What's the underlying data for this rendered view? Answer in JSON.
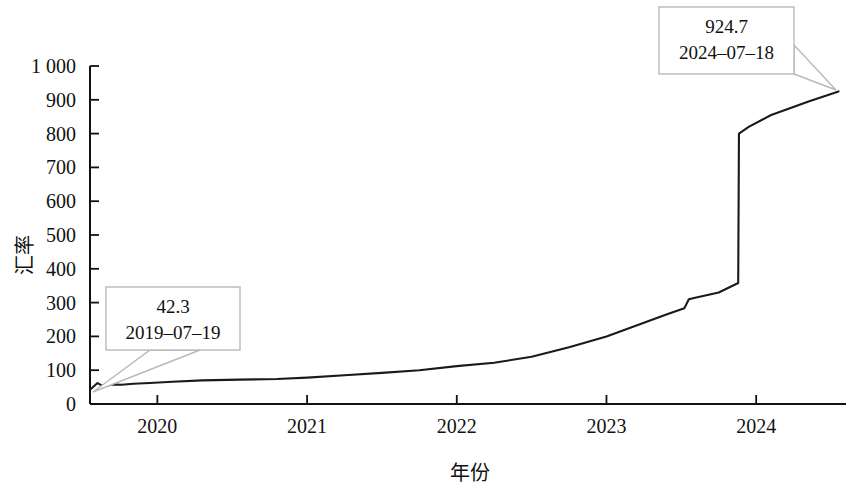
{
  "chart_data": {
    "type": "line",
    "title": "",
    "xlabel": "年份",
    "ylabel": "汇率",
    "xlim": [
      2019.55,
      2024.6
    ],
    "ylim": [
      0,
      1000
    ],
    "grid": false,
    "legend": null,
    "x_tick_labels": [
      "2020",
      "2021",
      "2022",
      "2023",
      "2024"
    ],
    "x_tick_values": [
      2020,
      2021,
      2022,
      2023,
      2024
    ],
    "y_tick_labels": [
      "0",
      "100",
      "200",
      "300",
      "400",
      "500",
      "600",
      "700",
      "800",
      "900",
      "1 000"
    ],
    "y_tick_values": [
      0,
      100,
      200,
      300,
      400,
      500,
      600,
      700,
      800,
      900,
      1000
    ],
    "series": [
      {
        "name": "汇率",
        "color": "#1a1a1a",
        "x": [
          2019.55,
          2019.6,
          2019.64,
          2019.7,
          2019.76,
          2019.84,
          2019.95,
          2020.1,
          2020.3,
          2020.55,
          2020.8,
          2021.0,
          2021.25,
          2021.5,
          2021.75,
          2022.0,
          2022.25,
          2022.5,
          2022.75,
          2023.0,
          2023.2,
          2023.4,
          2023.52,
          2023.55,
          2023.6,
          2023.75,
          2023.88,
          2023.885,
          2023.95,
          2024.1,
          2024.35,
          2024.55
        ],
        "y": [
          42.3,
          62,
          52,
          58,
          57,
          60,
          62,
          66,
          70,
          72,
          74,
          78,
          85,
          92,
          100,
          112,
          122,
          140,
          168,
          200,
          232,
          265,
          283,
          310,
          315,
          330,
          358,
          800,
          820,
          855,
          895,
          924.7
        ]
      }
    ],
    "annotations": [
      {
        "id": "start-point",
        "value": "42.3",
        "date": "2019–07–19",
        "box": {
          "x": 106,
          "y": 287,
          "w": 134,
          "h": 63
        },
        "target": {
          "x": 93,
          "y": 392
        },
        "tail": [
          [
            200,
            350
          ],
          [
            150,
            350
          ],
          [
            93,
            392
          ]
        ]
      },
      {
        "id": "end-point",
        "value": "924.7",
        "date": "2024–07–18",
        "box": {
          "x": 659,
          "y": 7,
          "w": 135,
          "h": 67
        },
        "target": {
          "x": 836,
          "y": 90
        },
        "tail": [
          [
            794,
            45
          ],
          [
            794,
            74
          ],
          [
            836,
            90
          ]
        ]
      }
    ]
  }
}
